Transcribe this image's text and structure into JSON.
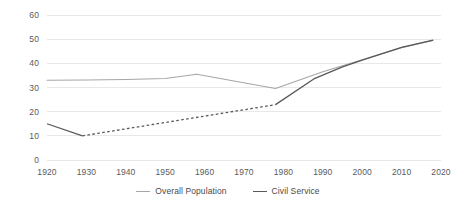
{
  "chart_data": {
    "type": "line",
    "title": "",
    "xlabel": "",
    "ylabel": "",
    "xlim": [
      1920,
      2020
    ],
    "ylim": [
      0,
      60
    ],
    "grid": true,
    "grid_axis": "y",
    "legend_position": "bottom",
    "x_ticks": [
      "1920",
      "1930",
      "1940",
      "1950",
      "1960",
      "1970",
      "1980",
      "1990",
      "2000",
      "2010",
      "2020"
    ],
    "y_ticks": [
      "0",
      "10",
      "20",
      "30",
      "40",
      "50",
      "60"
    ],
    "series": [
      {
        "name": "Overall Population",
        "color": "#a6a6a6",
        "style": "solid",
        "points": [
          {
            "x": 1920,
            "y": 33.0
          },
          {
            "x": 1930,
            "y": 33.1
          },
          {
            "x": 1940,
            "y": 33.3
          },
          {
            "x": 1950,
            "y": 33.7
          },
          {
            "x": 1958,
            "y": 35.5
          },
          {
            "x": 1978,
            "y": 29.6
          },
          {
            "x": 1990,
            "y": 36.5
          },
          {
            "x": 2000,
            "y": 41.5
          },
          {
            "x": 2010,
            "y": 46.5
          },
          {
            "x": 2018,
            "y": 49.5
          }
        ]
      },
      {
        "name": "Civil Service",
        "color": "#595959",
        "style": "mixed",
        "points": [
          {
            "x": 1920,
            "y": 15.0
          },
          {
            "x": 1929,
            "y": 10.0
          },
          {
            "x": 1978,
            "y": 22.9
          },
          {
            "x": 1988,
            "y": 33.8
          },
          {
            "x": 1995,
            "y": 38.5
          },
          {
            "x": 2000,
            "y": 41.3
          },
          {
            "x": 2010,
            "y": 46.6
          },
          {
            "x": 2018,
            "y": 49.6
          }
        ],
        "dashed_range": [
          1929,
          1978
        ]
      }
    ]
  },
  "legend": {
    "items": [
      {
        "label": "Overall Population",
        "color": "#a6a6a6"
      },
      {
        "label": "Civil Service",
        "color": "#595959"
      }
    ]
  },
  "axes": {
    "y_ticks": [
      {
        "label": "60",
        "value": 60
      },
      {
        "label": "50",
        "value": 50
      },
      {
        "label": "40",
        "value": 40
      },
      {
        "label": "30",
        "value": 30
      },
      {
        "label": "20",
        "value": 20
      },
      {
        "label": "10",
        "value": 10
      },
      {
        "label": "0",
        "value": 0
      }
    ],
    "x_ticks": [
      {
        "label": "1920",
        "value": 1920
      },
      {
        "label": "1930",
        "value": 1930
      },
      {
        "label": "1940",
        "value": 1940
      },
      {
        "label": "1950",
        "value": 1950
      },
      {
        "label": "1960",
        "value": 1960
      },
      {
        "label": "1970",
        "value": 1970
      },
      {
        "label": "1980",
        "value": 1980
      },
      {
        "label": "1990",
        "value": 1990
      },
      {
        "label": "2000",
        "value": 2000
      },
      {
        "label": "2010",
        "value": 2010
      },
      {
        "label": "2020",
        "value": 2020
      }
    ]
  },
  "style": {
    "grid_color": "#e8e8e8",
    "tick_text_color": "#5a5a5a",
    "background": "#ffffff"
  }
}
